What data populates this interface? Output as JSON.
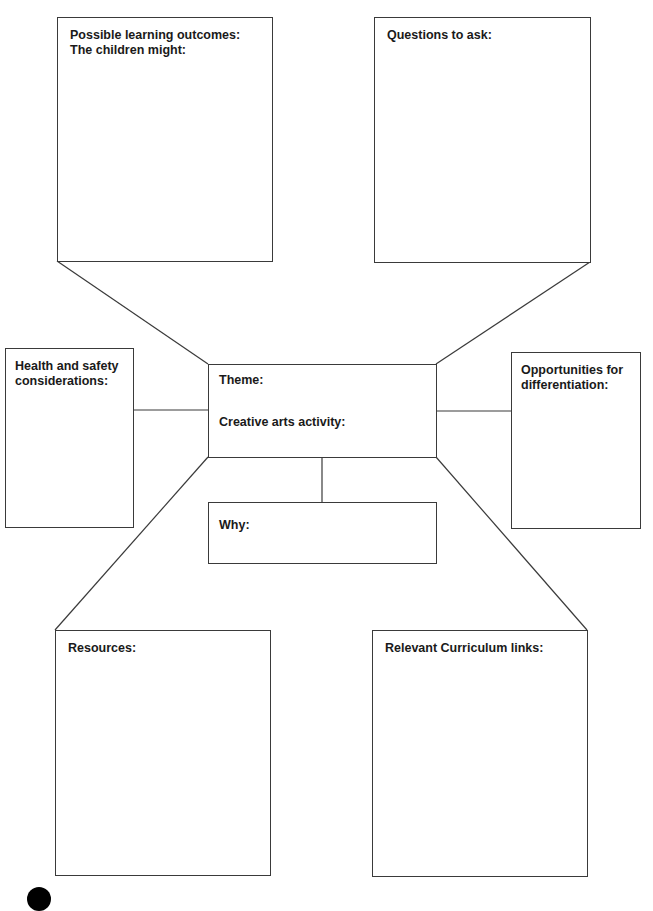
{
  "diagram": {
    "type": "activity-planning-spider-diagram",
    "colors": {
      "line": "#3a3a3a",
      "text": "#1a1a1a",
      "background": "#ffffff"
    },
    "centre": {
      "theme_label": "Theme:",
      "activity_label": "Creative arts activity:"
    },
    "boxes": {
      "learning_outcomes": "Possible learning outcomes:\nThe children might:",
      "questions": "Questions to ask:",
      "health_safety": "Health and safety\nconsiderations:",
      "differentiation": "Opportunities for\ndifferentiation:",
      "why": "Why:",
      "resources": "Resources:",
      "curriculum": "Relevant Curriculum links:"
    }
  }
}
